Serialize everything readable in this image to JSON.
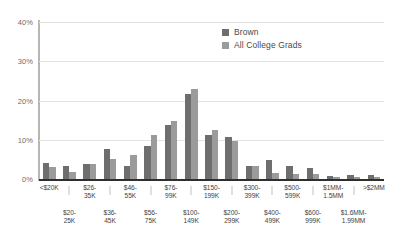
{
  "chart_data": {
    "type": "bar",
    "title": "",
    "xlabel": "",
    "ylabel": "",
    "ylim": [
      0,
      40
    ],
    "grid": true,
    "legend_position": "top-right",
    "ytick_labels": [
      "0%",
      "10%",
      "20%",
      "30%",
      "40%"
    ],
    "ytick_values": [
      0,
      10,
      20,
      30,
      40
    ],
    "categories": [
      "<$20K",
      "$20-25K",
      "$26-35K",
      "$36-45K",
      "$46-55K",
      "$56-75K",
      "$76-99K",
      "$100-149K",
      "$150-199K",
      "$200-299K",
      "$300-399K",
      "$400-499K",
      "$500-599K",
      "$600-999K",
      "$1MM-1.5MM",
      "$1.6MM-1.99MM",
      ">$2MM"
    ],
    "categories_display": [
      {
        "line1": "<$20K",
        "line2": ""
      },
      {
        "line1": "",
        "line2": "$20-\n25K"
      },
      {
        "line1": "$26-\n35K",
        "line2": ""
      },
      {
        "line1": "",
        "line2": "$36-\n45K"
      },
      {
        "line1": "$46-\n55K",
        "line2": ""
      },
      {
        "line1": "",
        "line2": "$56-\n75K"
      },
      {
        "line1": "$76-\n99K",
        "line2": ""
      },
      {
        "line1": "",
        "line2": "$100-\n149K"
      },
      {
        "line1": "$150-\n199K",
        "line2": ""
      },
      {
        "line1": "",
        "line2": "$200-\n299K"
      },
      {
        "line1": "$300-\n399K",
        "line2": ""
      },
      {
        "line1": "",
        "line2": "$400-\n499K"
      },
      {
        "line1": "$500-\n599K",
        "line2": ""
      },
      {
        "line1": "",
        "line2": "$600-\n999K"
      },
      {
        "line1": "$1MM-\n1.5MM",
        "line2": ""
      },
      {
        "line1": "",
        "line2": "$1.6MM-\n1.99MM"
      },
      {
        "line1": ">$2MM",
        "line2": ""
      }
    ],
    "series": [
      {
        "name": "Brown",
        "color": "#6e6e6e",
        "values": [
          4.1,
          3.3,
          3.8,
          7.7,
          3.3,
          8.4,
          13.7,
          21.7,
          11.1,
          10.7,
          3.2,
          4.8,
          3.4,
          2.7,
          0.8,
          0.9,
          0.9
        ]
      },
      {
        "name": "All College Grads",
        "color": "#9b9b9b",
        "values": [
          3.0,
          1.8,
          3.7,
          5.1,
          6.2,
          11.3,
          14.8,
          23.0,
          12.4,
          9.6,
          3.2,
          1.6,
          1.2,
          1.3,
          0.5,
          0.4,
          0.5
        ]
      }
    ]
  },
  "legend": {
    "items": [
      {
        "label": "Brown",
        "color": "#6e6e6e"
      },
      {
        "label": "All College Grads",
        "color": "#9b9b9b"
      }
    ]
  },
  "axis": {
    "y_labels": [
      {
        "text": "40%",
        "value": 40
      },
      {
        "text": "30%",
        "value": 30
      },
      {
        "text": "20%",
        "value": 20
      },
      {
        "text": "10%",
        "value": 10
      },
      {
        "text": "0%",
        "value": 0
      }
    ],
    "x_labels_upper": [
      {
        "text": "<$20K",
        "index": 0
      },
      {
        "text": "$26-\n35K",
        "index": 2
      },
      {
        "text": "$46-\n55K",
        "index": 4
      },
      {
        "text": "$76-\n99K",
        "index": 6
      },
      {
        "text": "$150-\n199K",
        "index": 8
      },
      {
        "text": "$300-\n399K",
        "index": 10
      },
      {
        "text": "$500-\n599K",
        "index": 12
      },
      {
        "text": "$1MM-\n1.5MM",
        "index": 14
      },
      {
        "text": ">$2MM",
        "index": 16
      }
    ],
    "x_labels_lower": [
      {
        "text": "$20-\n25K",
        "index": 1
      },
      {
        "text": "$36-\n45K",
        "index": 3
      },
      {
        "text": "$56-\n75K",
        "index": 5
      },
      {
        "text": "$100-\n149K",
        "index": 7
      },
      {
        "text": "$200-\n299K",
        "index": 9
      },
      {
        "text": "$400-\n499K",
        "index": 11
      },
      {
        "text": "$600-\n999K",
        "index": 13
      },
      {
        "text": "$1.6MM-\n1.99MM",
        "index": 15
      }
    ]
  },
  "colors": {
    "series_dark": "#6e6e6e",
    "series_light": "#9b9b9b",
    "gridline": "#e3e3e1",
    "baseline": "#2f2f2f",
    "axis": "#b6b6b4",
    "text": "#3f3f3f",
    "background": "#ffffff"
  }
}
